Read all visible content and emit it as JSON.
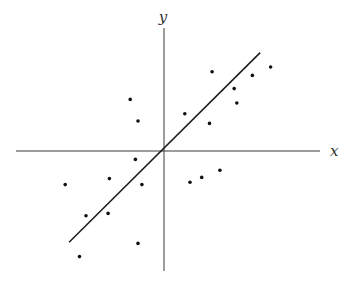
{
  "chart_data": {
    "type": "scatter",
    "title": "",
    "xlabel": "x",
    "ylabel": "y",
    "grid": false,
    "legend": null,
    "ticks": false,
    "xlim": [
      -1.0,
      1.0
    ],
    "ylim": [
      -1.0,
      1.0
    ],
    "note": "Unitless coordinates, normalized so the origin is the axis intersection; estimated from pixel positions.",
    "points": [
      {
        "x": 0.37,
        "y": 0.66
      },
      {
        "x": 0.68,
        "y": 0.63
      },
      {
        "x": 0.82,
        "y": 0.7
      },
      {
        "x": 0.54,
        "y": 0.52
      },
      {
        "x": 0.56,
        "y": 0.4
      },
      {
        "x": 0.16,
        "y": 0.31
      },
      {
        "x": 0.35,
        "y": 0.23
      },
      {
        "x": -0.26,
        "y": 0.43
      },
      {
        "x": -0.2,
        "y": 0.25
      },
      {
        "x": -0.22,
        "y": -0.07
      },
      {
        "x": -0.76,
        "y": -0.28
      },
      {
        "x": -0.42,
        "y": -0.23
      },
      {
        "x": -0.17,
        "y": -0.28
      },
      {
        "x": 0.2,
        "y": -0.26
      },
      {
        "x": 0.29,
        "y": -0.22
      },
      {
        "x": 0.43,
        "y": -0.16
      },
      {
        "x": -0.6,
        "y": -0.54
      },
      {
        "x": -0.43,
        "y": -0.52
      },
      {
        "x": -0.2,
        "y": -0.77
      },
      {
        "x": -0.65,
        "y": -0.88
      }
    ],
    "fit_line": {
      "x1": -0.73,
      "y1": -0.76,
      "x2": 0.74,
      "y2": 0.82
    }
  },
  "render": {
    "origin_px": [
      164,
      151
    ],
    "scale_px": [
      130,
      120
    ],
    "x_axis_px": [
      16,
      320
    ],
    "y_axis_px": [
      28,
      271
    ],
    "x_label_px": [
      330,
      156
    ],
    "y_label_px": [
      163,
      22
    ]
  }
}
